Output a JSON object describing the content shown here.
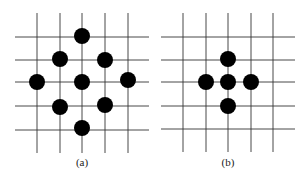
{
  "panels": [
    {
      "id": "a",
      "label": "(a)",
      "label_pos": [
        82,
        163
      ],
      "grid": {
        "vertical_x": [
          37,
          60,
          82,
          105,
          128
        ],
        "vertical_y_range": [
          13,
          153
        ],
        "horizontal_y": [
          37,
          60,
          82,
          106,
          130
        ],
        "horizontal_x_range": [
          15,
          149
        ]
      },
      "dots": [
        [
          82,
          36
        ],
        [
          60,
          59
        ],
        [
          105,
          60
        ],
        [
          37,
          82
        ],
        [
          82,
          82
        ],
        [
          128,
          80
        ],
        [
          60,
          107
        ],
        [
          105,
          105
        ],
        [
          82,
          128
        ]
      ]
    },
    {
      "id": "b",
      "label": "(b)",
      "label_pos": [
        228,
        163
      ],
      "grid": {
        "vertical_x": [
          183,
          206,
          228,
          251,
          273
        ],
        "vertical_y_range": [
          13,
          152
        ],
        "horizontal_y": [
          37,
          60,
          82,
          106,
          129
        ],
        "horizontal_x_range": [
          161,
          295
        ]
      },
      "dots": [
        [
          228,
          59
        ],
        [
          206,
          82
        ],
        [
          228,
          82
        ],
        [
          251,
          82
        ],
        [
          228,
          106
        ]
      ]
    }
  ],
  "style": {
    "line_color": "#333333",
    "dot_color": "#000000",
    "dot_radius": 8
  }
}
